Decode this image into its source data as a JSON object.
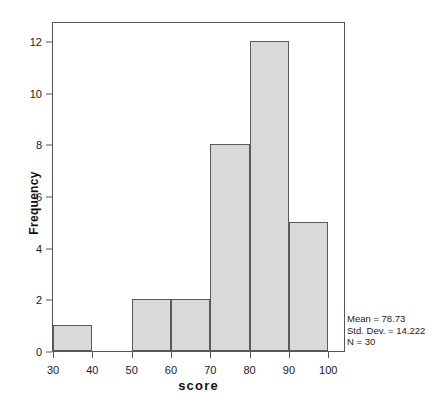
{
  "chart_data": {
    "type": "bar",
    "chart_subtype": "histogram",
    "title": "",
    "xlabel": "score",
    "ylabel": "Frequency",
    "bin_width": 10,
    "bin_edges": [
      30,
      40,
      50,
      60,
      70,
      80,
      90,
      100
    ],
    "categories": [
      "30-40",
      "40-50",
      "50-60",
      "60-70",
      "70-80",
      "80-90",
      "90-100"
    ],
    "values": [
      1,
      0,
      2,
      2,
      8,
      12,
      5
    ],
    "bins": [
      {
        "start": 30,
        "end": 40,
        "frequency": 1
      },
      {
        "start": 40,
        "end": 50,
        "frequency": 0
      },
      {
        "start": 50,
        "end": 60,
        "frequency": 2
      },
      {
        "start": 60,
        "end": 70,
        "frequency": 2
      },
      {
        "start": 70,
        "end": 80,
        "frequency": 8
      },
      {
        "start": 80,
        "end": 90,
        "frequency": 12
      },
      {
        "start": 90,
        "end": 100,
        "frequency": 5
      }
    ],
    "xlim": [
      30,
      104
    ],
    "ylim": [
      0,
      12.7
    ],
    "xticks": [
      30,
      40,
      50,
      60,
      70,
      80,
      90,
      100
    ],
    "yticks": [
      0,
      2,
      4,
      6,
      8,
      10,
      12
    ],
    "xtick_labels": [
      "30",
      "40",
      "50",
      "60",
      "70",
      "80",
      "90",
      "100"
    ],
    "ytick_labels": [
      "0",
      "2",
      "4",
      "6",
      "8",
      "10",
      "12"
    ],
    "grid": false,
    "legend": false,
    "bar_fill_color": "#d9d9d9",
    "bar_edge_color": "#5a5a5a",
    "frame_color": "#555555"
  },
  "annotation": {
    "mean_label": "Mean = 78.73",
    "std_label": "Std. Dev. = 14.222",
    "n_label": "N = 30"
  }
}
